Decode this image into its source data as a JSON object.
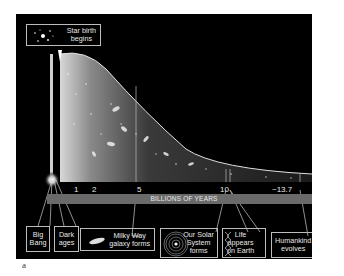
{
  "figure": {
    "caption_letter": "a",
    "background_color": "#000000",
    "axis": {
      "label": "BILLIONS OF YEARS",
      "ticks": [
        "1",
        "2",
        "5",
        "10",
        "~13.7"
      ],
      "bar_color": "#6a6a6a"
    },
    "events": [
      {
        "id": "big-bang",
        "label_line1": "Big",
        "label_line2": "Bang",
        "icon": "burst-icon"
      },
      {
        "id": "dark-ages",
        "label_line1": "Dark",
        "label_line2": "ages"
      },
      {
        "id": "star-birth",
        "label_line1": "Star birth",
        "label_line2": "begins",
        "icon": "star-cluster-icon"
      },
      {
        "id": "milky-way",
        "label_line1": "Milky Way",
        "label_line2": "galaxy forms",
        "icon": "galaxy-icon"
      },
      {
        "id": "solar-system",
        "label_line1": "Our Solar",
        "label_line2": "System",
        "label_line3": "forms",
        "icon": "solar-system-icon"
      },
      {
        "id": "life",
        "label_line1": "Life",
        "label_line2": "appears",
        "label_line3": "on Earth",
        "icon": "dna-icon"
      },
      {
        "id": "humankind",
        "label_line1": "Humankind",
        "label_line2": "evolves",
        "icon": "human-figure-icon"
      }
    ]
  }
}
